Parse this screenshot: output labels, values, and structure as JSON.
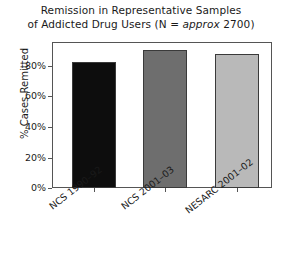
{
  "chart_data": {
    "type": "bar",
    "title": "Remission in Representative Samples of Addicted Drug Users (N = approx 2700)",
    "title_line1": "Remission in Representative Samples",
    "title_line2_pre": "of Addicted Drug Users (N = ",
    "title_line2_italic": "approx",
    "title_line2_post": " 2700)",
    "categories": [
      "NCS 1990–92",
      "NCS 2001–03",
      "NESARC 2001–02"
    ],
    "values": [
      76,
      83,
      81
    ],
    "value_labels": [
      "76%",
      "83%",
      "81%"
    ],
    "bar_colors": [
      "#0d0d0d",
      "#6e6e6e",
      "#b9b9b9"
    ],
    "xlabel": "",
    "ylabel": "% Cases Remitted",
    "ylim": [
      0,
      88
    ],
    "yticks": [
      0,
      20,
      40,
      60,
      80
    ],
    "ytick_labels": [
      "0%",
      "20%",
      "40%",
      "60%",
      "80%"
    ],
    "grid": false,
    "legend": "none"
  },
  "axes": {
    "y_title": "% Cases Remitted",
    "ticks": [
      {
        "label": "80%",
        "value": 80
      },
      {
        "label": "60%",
        "value": 60
      },
      {
        "label": "40%",
        "value": 40
      },
      {
        "label": "20%",
        "value": 20
      },
      {
        "label": "0%",
        "value": 0
      }
    ]
  },
  "bars": [
    {
      "label": "NCS 1990–92",
      "value": 76,
      "color": "#0d0d0d"
    },
    {
      "label": "NCS 2001–03",
      "value": 83,
      "color": "#6e6e6e"
    },
    {
      "label": "NESARC 2001–02",
      "value": 81,
      "color": "#b9b9b9"
    }
  ],
  "colors": {
    "frame": "#555555",
    "text": "#1a1a1a",
    "background": "#ffffff"
  }
}
